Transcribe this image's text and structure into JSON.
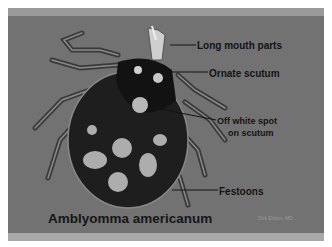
{
  "slide": {
    "title": "Amblyomma americanum",
    "credit": "Dirk Elston, MD",
    "labels": [
      {
        "text": "Long mouth parts"
      },
      {
        "text": "Ornate scutum"
      },
      {
        "text": "Off white spot"
      },
      {
        "text": "on scutum"
      },
      {
        "text": "Festoons"
      }
    ],
    "image_subject": "tick specimen (dorsal view)"
  },
  "colors": {
    "background": "#727272",
    "label_text": "#141414",
    "credit_text": "#9c9c9c",
    "frame": "#ffffff"
  }
}
